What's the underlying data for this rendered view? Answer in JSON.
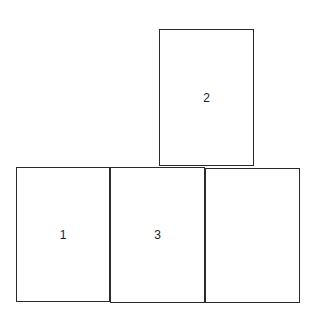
{
  "diagram": {
    "type": "card-layout",
    "stroke_color": "#2a2a2a",
    "background_color": "#ffffff",
    "boxes": [
      {
        "id": "top",
        "label": "2",
        "row": "top",
        "position": "above third column"
      },
      {
        "id": "bottom-left",
        "label": "1",
        "row": "bottom",
        "position": "column 1"
      },
      {
        "id": "bottom-mid",
        "label": "3",
        "row": "bottom",
        "position": "column 2"
      },
      {
        "id": "bottom-right",
        "label": "",
        "row": "bottom",
        "position": "column 3"
      }
    ]
  }
}
